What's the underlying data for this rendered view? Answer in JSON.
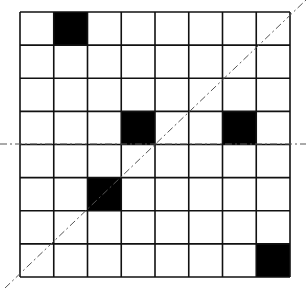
{
  "diagram": {
    "type": "grid-symmetry-figure",
    "grid": {
      "rows": 8,
      "cols": 8,
      "left": 20,
      "top": 12,
      "right": 290,
      "bottom": 277,
      "line_color": "#111111",
      "line_width": 1.6
    },
    "filled_cells": [
      {
        "row": 0,
        "col": 1
      },
      {
        "row": 3,
        "col": 3
      },
      {
        "row": 3,
        "col": 6
      },
      {
        "row": 5,
        "col": 2
      },
      {
        "row": 7,
        "col": 7
      }
    ],
    "fill_color": "#000000",
    "axes": [
      {
        "name": "horizontal-axis",
        "style": "dash-dot",
        "x1": 0,
        "y1": 144,
        "x2": 306,
        "y2": 144
      },
      {
        "name": "diagonal-axis",
        "style": "dash-dot",
        "x1": 5,
        "y1": 288,
        "x2": 306,
        "y2": 0
      }
    ],
    "axis_color": "#555555"
  }
}
